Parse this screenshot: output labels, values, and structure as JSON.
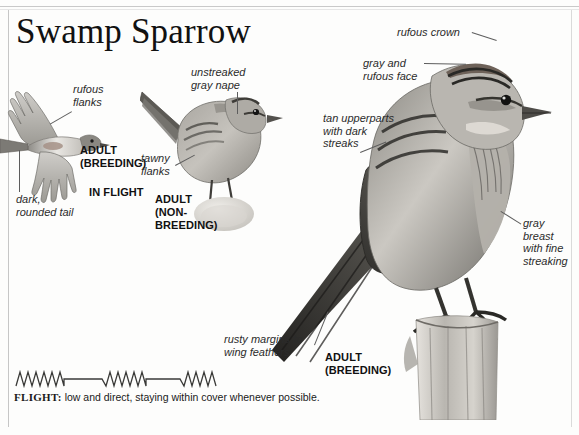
{
  "page": {
    "title": "Swamp Sparrow"
  },
  "labels": {
    "rufous_flanks": "rufous\nflanks",
    "dark_rounded_tail": "dark,\nrounded tail",
    "unstreaked_gray_nape": "unstreaked\ngray nape",
    "tawny_flanks": "tawny\nflanks",
    "rufous_crown": "rufous crown",
    "gray_and_rufous_face": "gray and\nrufous face",
    "tan_upperparts": "tan upperparts\nwith dark\nstreaks",
    "gray_breast": "gray\nbreast\nwith fine\nstreaking",
    "rusty_margins": "rusty margins to\nwing feathers"
  },
  "captions": {
    "adult_breeding_flight": "ADULT\n(BREEDING)",
    "in_flight": "IN FLIGHT",
    "adult_nonbreeding": "ADULT\n(NON-\nBREEDING)",
    "adult_breeding_perched": "ADULT\n(BREEDING)"
  },
  "flight": {
    "heading": "FLIGHT:",
    "text": " low and direct, staying within cover whenever possible."
  },
  "colors": {
    "ink": "#111111",
    "leader": "#5d5d5d",
    "rule": "#c6c6c6",
    "plumage_dark": "#3a3a3a",
    "plumage_mid": "#8d8d8d",
    "plumage_light": "#d8d6d2"
  }
}
